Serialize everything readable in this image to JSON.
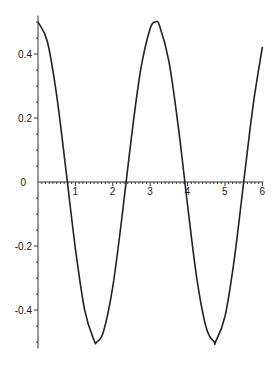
{
  "chart_data": {
    "type": "line",
    "title": "",
    "xlabel": "",
    "ylabel": "",
    "xlim": [
      0,
      6
    ],
    "ylim": [
      -0.52,
      0.52
    ],
    "grid": false,
    "legend": null,
    "x_ticks": [
      "1",
      "2",
      "3",
      "4",
      "5",
      "6"
    ],
    "y_ticks": [
      "0.4",
      "0.2",
      "0",
      "-0.2",
      "-0.4"
    ],
    "series": [
      {
        "name": "0.5*cos(2x)",
        "color": "#222222",
        "x": [
          0,
          0.25,
          0.5,
          0.75,
          1.0,
          1.25,
          1.5,
          1.5708,
          1.75,
          2.0,
          2.25,
          2.5,
          2.75,
          3.0,
          3.1416,
          3.25,
          3.5,
          3.75,
          4.0,
          4.25,
          4.5,
          4.7124,
          4.75,
          5.0,
          5.25,
          5.5,
          5.75,
          6.0
        ],
        "y": [
          0.5,
          0.439,
          0.27,
          0.035,
          -0.208,
          -0.401,
          -0.495,
          -0.5,
          -0.468,
          -0.327,
          -0.105,
          0.142,
          0.354,
          0.48,
          0.5,
          0.488,
          0.377,
          0.174,
          -0.073,
          -0.304,
          -0.456,
          -0.5,
          -0.499,
          -0.42,
          -0.24,
          0.0,
          0.238,
          0.422
        ]
      }
    ]
  }
}
